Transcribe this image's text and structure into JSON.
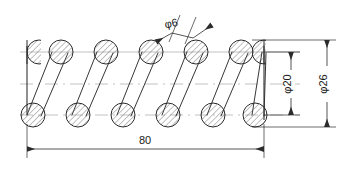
{
  "drawing": {
    "title": "compression-spring-cross-section",
    "line_color": "#2b2b2b",
    "hatch_color": "#555555",
    "centerline_color": "#9a9a9a",
    "background": "#ffffff"
  },
  "dimensions": {
    "wire_diameter": {
      "label": "φ6",
      "name": "wire-diameter-dimension",
      "value": 6,
      "symbol": "φ"
    },
    "inner_diameter": {
      "label": "φ20",
      "name": "inner-diameter-dimension",
      "value": 20,
      "symbol": "φ"
    },
    "outer_diameter": {
      "label": "φ26",
      "name": "outer-diameter-dimension",
      "value": 26,
      "symbol": "φ"
    },
    "free_length": {
      "label": "80",
      "name": "free-length-dimension",
      "value": 80
    }
  },
  "geometry": {
    "spring": {
      "top_row_y": 52,
      "bottom_row_y": 115,
      "circle_radius": 12,
      "full_circle_count_top": 5,
      "full_circle_count_bottom": 6,
      "top_circle_x": [
        61,
        106,
        151,
        196,
        241
      ],
      "bottom_circle_x": [
        33,
        78,
        123,
        168,
        213,
        258
      ],
      "left_end_x": 27,
      "right_end_x": 264
    }
  }
}
